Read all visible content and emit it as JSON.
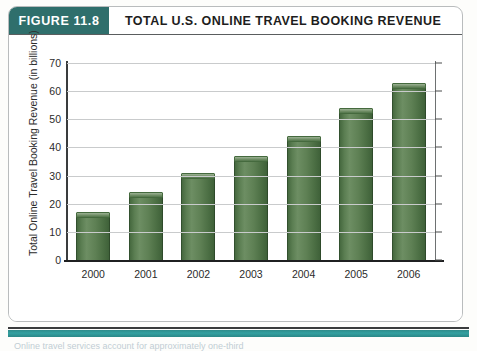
{
  "figure": {
    "tag": "FIGURE 11.8",
    "title": "TOTAL U.S. ONLINE TRAVEL BOOKING REVENUE",
    "tag_color": "#2f6f6c",
    "accent_color": "#33a0a0",
    "bar_color": "#5b7e52",
    "caption": "Online travel services account for approximately one-third"
  },
  "chart_data": {
    "type": "bar",
    "title": "TOTAL U.S. ONLINE TRAVEL BOOKING REVENUE",
    "categories": [
      "2000",
      "2001",
      "2002",
      "2003",
      "2004",
      "2005",
      "2006"
    ],
    "values": [
      17,
      24,
      31,
      37,
      44,
      54,
      63
    ],
    "xlabel": "Year",
    "ylabel": "Total Online Travel Booking Revenue (in billions)",
    "ylim": [
      0,
      70
    ],
    "yticks": [
      0,
      10,
      20,
      30,
      40,
      50,
      60,
      70
    ],
    "ytick_labels": [
      "0",
      "10",
      "20",
      "30",
      "40",
      "50",
      "60",
      "70"
    ],
    "grid": true,
    "legend": false
  }
}
